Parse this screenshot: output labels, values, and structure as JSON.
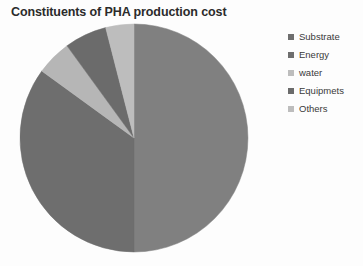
{
  "chart_data": {
    "type": "pie",
    "title": "Constituents of PHA production cost",
    "xlabel": "",
    "ylabel": "",
    "legend_position": "right",
    "grid": false,
    "categories": [
      "Substrate",
      "Energy",
      "water",
      "Equipmets",
      "Others"
    ],
    "values": [
      50,
      35,
      5,
      6,
      4
    ],
    "unit": "%",
    "colors": [
      "#808080",
      "#6e6e6e",
      "#b6b6b6",
      "#6b6b6b",
      "#bdbdbd"
    ],
    "slices": [
      {
        "label": "Substrate",
        "value": 50,
        "color": "#808080",
        "start_angle": 0,
        "end_angle": 180
      },
      {
        "label": "Energy",
        "value": 35,
        "color": "#6e6e6e",
        "start_angle": 180,
        "end_angle": 306
      },
      {
        "label": "water",
        "value": 5,
        "color": "#b6b6b6",
        "start_angle": 306,
        "end_angle": 324
      },
      {
        "label": "Equipmets",
        "value": 6,
        "color": "#6b6b6b",
        "start_angle": 324,
        "end_angle": 345.6
      },
      {
        "label": "Others",
        "value": 4,
        "color": "#bdbdbd",
        "start_angle": 345.6,
        "end_angle": 360
      }
    ]
  },
  "legend": {
    "items": [
      {
        "label": "Substrate",
        "color": "#6e6e6e"
      },
      {
        "label": "Energy",
        "color": "#6e6e6e"
      },
      {
        "label": "water",
        "color": "#bdbdbd"
      },
      {
        "label": "Equipmets",
        "color": "#6b6b6b"
      },
      {
        "label": "Others",
        "color": "#bdbdbd"
      }
    ]
  }
}
